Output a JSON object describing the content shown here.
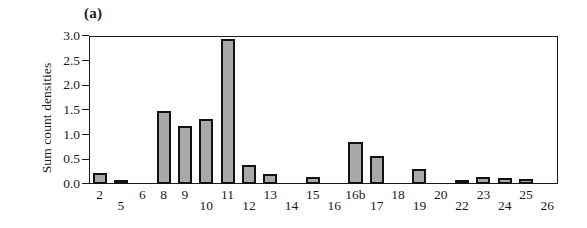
{
  "figure": {
    "panel_label": "(a)",
    "bar_fill_color": "#a9a9a9",
    "bar_edge_color": "#121212",
    "axis_color": "#1a1a1a",
    "background_color": "#ffffff"
  },
  "chart_data": {
    "type": "bar",
    "title": "(a)",
    "xlabel": "",
    "ylabel": "Sum count densities",
    "ylim": [
      0.0,
      3.0
    ],
    "yticks": [
      0.0,
      0.5,
      1.0,
      1.5,
      2.0,
      2.5,
      3.0
    ],
    "ytick_labels": [
      "0.0",
      "0.5",
      "1.0",
      "1.5",
      "2.0",
      "2.5",
      "3.0"
    ],
    "grid": false,
    "legend": null,
    "categories": [
      "2",
      "5",
      "6",
      "8",
      "9",
      "10",
      "11",
      "12",
      "13",
      "14",
      "15",
      "16",
      "16b",
      "17",
      "18",
      "19",
      "20",
      "22",
      "23",
      "24",
      "25",
      "26"
    ],
    "values": [
      0.22,
      0.02,
      0.0,
      1.47,
      1.17,
      1.31,
      2.94,
      0.39,
      0.2,
      0.0,
      0.14,
      0.0,
      0.86,
      0.57,
      0.0,
      0.31,
      0.0,
      0.06,
      0.14,
      0.13,
      0.11,
      0.0
    ],
    "tick_label_levels": [
      "high",
      "low",
      "high",
      "high",
      "high",
      "low",
      "high",
      "low",
      "high",
      "low",
      "high",
      "low",
      "high",
      "low",
      "high",
      "low",
      "high",
      "low",
      "high",
      "low",
      "high",
      "low"
    ]
  }
}
